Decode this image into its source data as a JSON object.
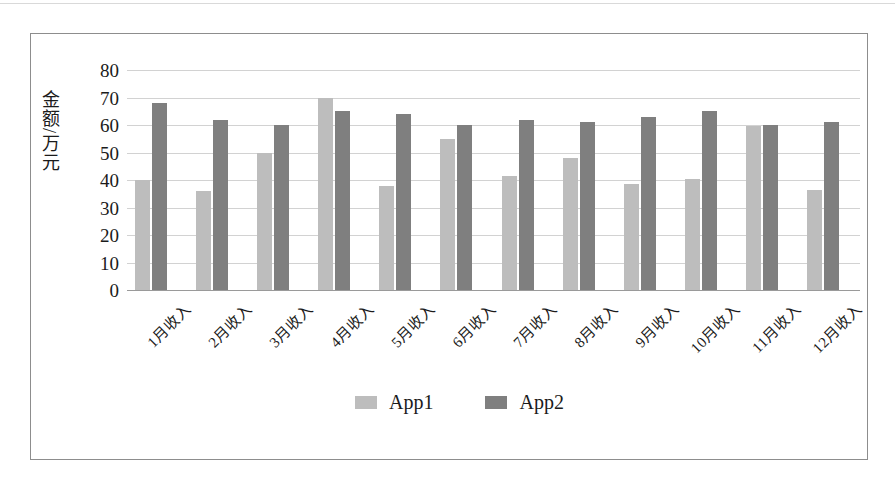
{
  "chart_data": {
    "type": "bar",
    "title": "",
    "subtitle": "",
    "xlabel": "",
    "ylabel": "金额/万元",
    "ylim": [
      0,
      80
    ],
    "y_ticks": [
      0,
      10,
      20,
      30,
      40,
      50,
      60,
      70,
      80
    ],
    "grid": true,
    "legend_position": "bottom",
    "categories": [
      "1月收入",
      "2月收入",
      "3月收入",
      "4月收入",
      "5月收入",
      "6月收入",
      "7月收入",
      "8月收入",
      "9月收入",
      "10月收入",
      "11月收入",
      "12月收入"
    ],
    "series": [
      {
        "name": "App1",
        "color": "#bdbdbd",
        "values": [
          40,
          36,
          50,
          70,
          38,
          55,
          41.5,
          48,
          38.5,
          40.5,
          59.5,
          36.5
        ]
      },
      {
        "name": "App2",
        "color": "#7f7f7f",
        "values": [
          68,
          62,
          60,
          65,
          64,
          60,
          62,
          61,
          63,
          65,
          60,
          61
        ]
      }
    ]
  },
  "legend": {
    "items": [
      {
        "label": "App1",
        "color": "#bdbdbd"
      },
      {
        "label": "App2",
        "color": "#7f7f7f"
      }
    ]
  },
  "colors": {
    "series_1": "#bdbdbd",
    "series_2": "#7f7f7f",
    "gridline": "#d2d2d2",
    "frame": "#8d8d8d",
    "text": "#1b1b1b",
    "background": "#ffffff"
  }
}
